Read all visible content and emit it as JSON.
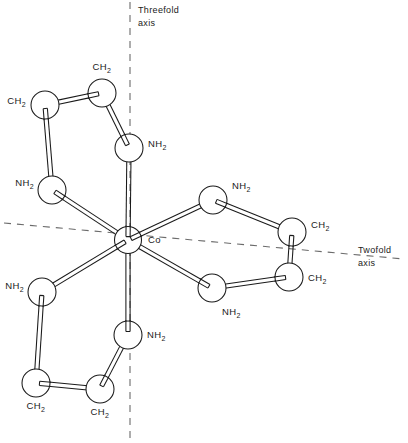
{
  "figure": {
    "background_color": "#ffffff",
    "line_color": "#1a1a1a",
    "axis_color": "#6b6b6b",
    "width": 408,
    "height": 443
  },
  "center": {
    "label": "Co",
    "label_x": 148,
    "label_y": 243,
    "x": 128,
    "y": 240,
    "r": 13.5
  },
  "axes": [
    {
      "name": "threefold-axis",
      "label_line1": "Threefold",
      "label_line2": "axis",
      "label_x": 138,
      "label_y1": 13,
      "label_y2": 26,
      "x1": 130,
      "y1": 2,
      "x2": 130,
      "y2": 441
    },
    {
      "name": "twofold-axis",
      "label_line1": "Twofold",
      "label_line2": "axis",
      "label_x": 358,
      "label_y1": 253,
      "label_y2": 266,
      "x1": 4,
      "y1": 223,
      "x2": 404,
      "y2": 259
    }
  ],
  "atoms": [
    {
      "id": "n1",
      "label": "NH2",
      "x": 129,
      "y": 148,
      "r": 14,
      "label_x": 148,
      "label_y": 147,
      "anchor": "start"
    },
    {
      "id": "c1",
      "label": "CH2",
      "x": 102,
      "y": 93,
      "r": 14,
      "label_x": 102,
      "label_y": 70,
      "anchor": "middle"
    },
    {
      "id": "c2",
      "label": "CH2",
      "x": 45,
      "y": 105,
      "r": 14,
      "label_x": 26,
      "label_y": 104,
      "anchor": "end"
    },
    {
      "id": "n2",
      "label": "NH2",
      "x": 52,
      "y": 190,
      "r": 14,
      "label_x": 34,
      "label_y": 186,
      "anchor": "end"
    },
    {
      "id": "n3",
      "label": "NH2",
      "x": 213,
      "y": 200,
      "r": 14,
      "label_x": 232,
      "label_y": 189,
      "anchor": "start"
    },
    {
      "id": "c3",
      "label": "CH2",
      "x": 292,
      "y": 232,
      "r": 14,
      "label_x": 311,
      "label_y": 228,
      "anchor": "start"
    },
    {
      "id": "c4",
      "label": "CH2",
      "x": 289,
      "y": 277,
      "r": 14,
      "label_x": 308,
      "label_y": 281,
      "anchor": "start"
    },
    {
      "id": "n4",
      "label": "NH2",
      "x": 212,
      "y": 288,
      "r": 14,
      "label_x": 222,
      "label_y": 315,
      "anchor": "start"
    },
    {
      "id": "n5",
      "label": "NH2",
      "x": 42,
      "y": 292,
      "r": 14,
      "label_x": 24,
      "label_y": 289,
      "anchor": "end"
    },
    {
      "id": "c5",
      "label": "CH2",
      "x": 36,
      "y": 383,
      "r": 14,
      "label_x": 36,
      "label_y": 409,
      "anchor": "middle"
    },
    {
      "id": "c6",
      "label": "CH2",
      "x": 100,
      "y": 389,
      "r": 14,
      "label_x": 100,
      "label_y": 415,
      "anchor": "middle"
    },
    {
      "id": "n6",
      "label": "NH2",
      "x": 128,
      "y": 335,
      "r": 14,
      "label_x": 147,
      "label_y": 338,
      "anchor": "start"
    }
  ],
  "bonds": [
    {
      "from": "center",
      "to": "n1",
      "width": 4.2
    },
    {
      "from": "n1",
      "to": "c1",
      "width": 4.2
    },
    {
      "from": "c1",
      "to": "c2",
      "width": 4.2
    },
    {
      "from": "c2",
      "to": "n2",
      "width": 4.2
    },
    {
      "from": "n2",
      "to": "center",
      "width": 4.2
    },
    {
      "from": "center",
      "to": "n3",
      "width": 4.2
    },
    {
      "from": "n3",
      "to": "c3",
      "width": 4.2
    },
    {
      "from": "c3",
      "to": "c4",
      "width": 4.2
    },
    {
      "from": "c4",
      "to": "n4",
      "width": 4.2
    },
    {
      "from": "n4",
      "to": "center",
      "width": 4.2
    },
    {
      "from": "center",
      "to": "n5",
      "width": 4.2
    },
    {
      "from": "n5",
      "to": "c5",
      "width": 4.2
    },
    {
      "from": "c5",
      "to": "c6",
      "width": 4.2
    },
    {
      "from": "c6",
      "to": "n6",
      "width": 4.2
    },
    {
      "from": "n6",
      "to": "center",
      "width": 4.2
    }
  ]
}
